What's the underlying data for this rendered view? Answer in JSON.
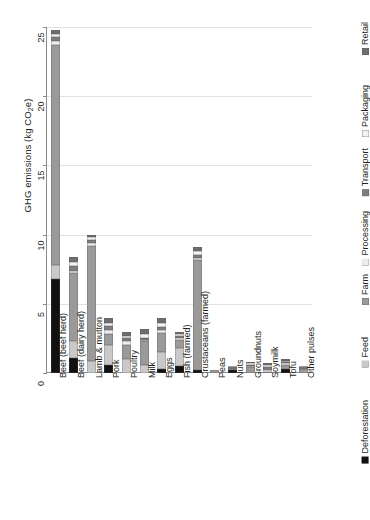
{
  "chart_data": {
    "type": "bar",
    "subtype": "stacked-bar",
    "title": "",
    "xlabel": "",
    "ylabel": "GHG emissions (kg CO₂e)",
    "ylabel_parts": {
      "pre": "GHG emissions (kg CO",
      "sub": "2",
      "post": "e)"
    },
    "ylim": [
      0,
      25
    ],
    "yticks": [
      0,
      5,
      10,
      15,
      20,
      25
    ],
    "ytick_labels": [
      "0",
      "5",
      "10",
      "15",
      "20",
      "25"
    ],
    "grid": "horizontal",
    "legend_position": "right",
    "categories": [
      "Beef (beef herd)",
      "Beef (dairy herd)",
      "Lamb & mutton",
      "Pork",
      "Poultry",
      "Milk",
      "Eggs",
      "Fish (farmed)",
      "Crustaceans (farmed)",
      "Peas",
      "Nuts",
      "Groundnuts",
      "Soymilk",
      "Tofu",
      "Other pulses"
    ],
    "series": [
      {
        "name": "Deforestation",
        "color": "#111111",
        "values": [
          6.8,
          1.1,
          0.0,
          0.6,
          0.0,
          0.0,
          0.3,
          0.5,
          0.2,
          0.0,
          0.2,
          0.0,
          0.0,
          0.3,
          0.0
        ]
      },
      {
        "name": "Feed",
        "color": "#c9c9c9",
        "values": [
          1.0,
          1.2,
          0.9,
          1.4,
          1.0,
          0.6,
          1.2,
          1.3,
          0.0,
          0.0,
          0.0,
          0.0,
          0.0,
          0.0,
          0.0
        ]
      },
      {
        "name": "Farm",
        "color": "#9a9a9a",
        "values": [
          15.9,
          4.9,
          8.3,
          0.8,
          1.0,
          1.7,
          1.4,
          0.6,
          8.0,
          0.2,
          0.1,
          0.4,
          0.1,
          0.3,
          0.3
        ]
      },
      {
        "name": "Processing",
        "color": "#ededed",
        "values": [
          0.3,
          0.2,
          0.2,
          0.3,
          0.3,
          0.1,
          0.2,
          0.1,
          0.1,
          0.0,
          0.0,
          0.1,
          0.1,
          0.1,
          0.0
        ]
      },
      {
        "name": "Transport",
        "color": "#7d7d7d",
        "values": [
          0.3,
          0.3,
          0.2,
          0.3,
          0.2,
          0.1,
          0.2,
          0.2,
          0.2,
          0.0,
          0.1,
          0.1,
          0.2,
          0.1,
          0.1
        ]
      },
      {
        "name": "Packaging",
        "color": "#f2f2f2",
        "values": [
          0.2,
          0.3,
          0.2,
          0.2,
          0.2,
          0.3,
          0.3,
          0.1,
          0.3,
          0.0,
          0.1,
          0.1,
          0.2,
          0.1,
          0.1
        ]
      },
      {
        "name": "Retail",
        "color": "#6e6e6e",
        "values": [
          0.3,
          0.4,
          0.2,
          0.4,
          0.3,
          0.4,
          0.4,
          0.2,
          0.3,
          0.0,
          0.0,
          0.1,
          0.1,
          0.1,
          0.0
        ]
      }
    ],
    "totals": [
      24.8,
      8.4,
      10.0,
      4.0,
      3.0,
      3.2,
      4.0,
      3.0,
      9.1,
      0.2,
      0.5,
      0.8,
      0.7,
      1.0,
      0.5
    ]
  },
  "legend": {
    "items": [
      {
        "label": "Deforestation"
      },
      {
        "label": "Feed"
      },
      {
        "label": "Farm"
      },
      {
        "label": "Processing"
      },
      {
        "label": "Transport"
      },
      {
        "label": "Packaging"
      },
      {
        "label": "Retail"
      }
    ]
  },
  "colors": {
    "axis": "#8b8b8b",
    "gridline": "#e2e2e2",
    "text": "#231f20",
    "background": "#ffffff"
  }
}
